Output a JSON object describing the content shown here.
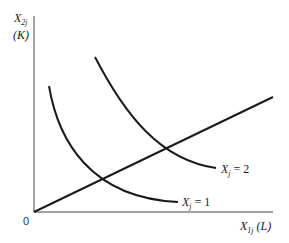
{
  "diagram": {
    "type": "isoquant-expansion-path",
    "axes": {
      "y": {
        "symbol": "X",
        "subscript": "2j",
        "unit": "(K)"
      },
      "x": {
        "symbol": "X",
        "subscript": "1j",
        "unit": "(L)"
      },
      "origin": "0"
    },
    "curves": [
      {
        "id": "isoquant-1",
        "label_symbol": "X",
        "label_subscript": "j",
        "label_value": "= 1"
      },
      {
        "id": "isoquant-2",
        "label_symbol": "X",
        "label_subscript": "j",
        "label_value": "= 2"
      }
    ],
    "ray": {
      "id": "expansion-path",
      "from": "origin"
    },
    "colors": {
      "stroke": "#1a1a1a",
      "background": "#ffffff"
    }
  }
}
